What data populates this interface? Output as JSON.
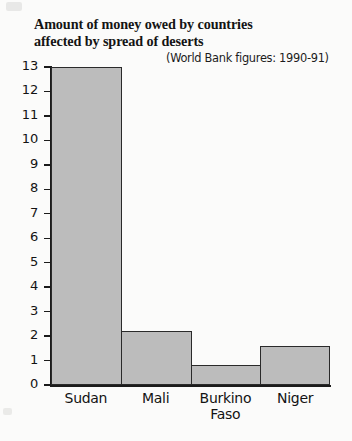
{
  "figure": {
    "title_line1": "Amount of money owed by countries",
    "title_line2": "affected by spread of deserts",
    "subtitle": "(World Bank figures: 1990-91)"
  },
  "chart_data": {
    "type": "bar",
    "title": "Amount of money owed by countries affected by spread of deserts",
    "subtitle": "(World Bank figures: 1990-91)",
    "xlabel": "",
    "ylabel": "Billion Dollars (US)",
    "categories": [
      "Sudan",
      "Mali",
      "Burkino Faso",
      "Niger"
    ],
    "category_lines": [
      [
        "Sudan"
      ],
      [
        "Mali"
      ],
      [
        "Burkino",
        "Faso"
      ],
      [
        "Niger"
      ]
    ],
    "values": [
      13.0,
      2.2,
      0.8,
      1.6
    ],
    "ylim": [
      0,
      13
    ],
    "ytick_labels": [
      "13",
      "12",
      "11",
      "10",
      "9",
      "8",
      "7",
      "6",
      "5",
      "4",
      "3",
      "2",
      "1",
      "0"
    ],
    "ytick_values": [
      13,
      12,
      11,
      10,
      9,
      8,
      7,
      6,
      5,
      4,
      3,
      2,
      1,
      0
    ],
    "grid": false,
    "legend": null,
    "bar_fill": "#bcbcbc",
    "bar_edge": "#2a2a2a",
    "axis_color": "#1b1b1b",
    "background": "#fbfbfa"
  }
}
